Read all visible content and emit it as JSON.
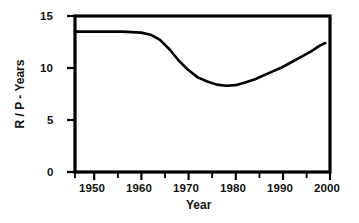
{
  "chart_data": {
    "type": "line",
    "title": "",
    "xlabel": "Year",
    "ylabel": "R / P - Years",
    "xlim": [
      1946,
      2000
    ],
    "ylim": [
      0,
      15
    ],
    "grid": false,
    "legend": null,
    "x_ticks": [
      1950,
      1960,
      1970,
      1980,
      1990,
      2000
    ],
    "x_tick_labels": [
      "1950",
      "1960",
      "1970",
      "1980",
      "1990",
      "2000"
    ],
    "x_minor_tick_interval": 5,
    "y_ticks": [
      0,
      5,
      10,
      15
    ],
    "y_tick_labels": [
      "0",
      "5",
      "10",
      "15"
    ],
    "line_color": "#000000",
    "line_width": 2.6,
    "series": [
      {
        "name": "R / P",
        "x": [
          1946,
          1948,
          1950,
          1952,
          1954,
          1956,
          1958,
          1960,
          1962,
          1964,
          1966,
          1968,
          1970,
          1972,
          1974,
          1976,
          1978,
          1980,
          1982,
          1984,
          1986,
          1988,
          1990,
          1992,
          1994,
          1996,
          1998,
          1999
        ],
        "values": [
          13.5,
          13.5,
          13.5,
          13.5,
          13.5,
          13.5,
          13.45,
          13.4,
          13.2,
          12.7,
          11.8,
          10.7,
          9.8,
          9.1,
          8.7,
          8.4,
          8.3,
          8.35,
          8.6,
          8.9,
          9.3,
          9.7,
          10.1,
          10.6,
          11.1,
          11.6,
          12.2,
          12.4
        ]
      }
    ]
  },
  "axis": {
    "x_title": "Year",
    "y_title": "R / P - Years"
  },
  "ticks": {
    "x": [
      "1950",
      "1960",
      "1970",
      "1980",
      "1990",
      "2000"
    ],
    "y": [
      "15",
      "10",
      "5",
      "0"
    ]
  }
}
